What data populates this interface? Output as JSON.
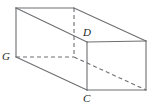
{
  "figure": {
    "type": "rectangular-prism-line-drawing",
    "stroke_color": "#6d6e71",
    "hidden_stroke_color": "#6d6e71",
    "background_color": "#ffffff",
    "stroke_width": 1,
    "dash_pattern": "4 3",
    "labels": {
      "g": "G",
      "d": "D",
      "c": "C"
    },
    "vertices": {
      "top_front_left": {
        "x": 16,
        "y": 8
      },
      "top_back_left": {
        "x": 74,
        "y": 8
      },
      "top_back_right": {
        "x": 146,
        "y": 41
      },
      "top_front_right_D": {
        "x": 87,
        "y": 42
      },
      "bottom_front_left_G": {
        "x": 16,
        "y": 57
      },
      "bottom_back_left": {
        "x": 74,
        "y": 57
      },
      "bottom_back_right": {
        "x": 146,
        "y": 90
      },
      "bottom_front_right_C": {
        "x": 87,
        "y": 90
      }
    },
    "edges": [
      {
        "name": "top-left-edge",
        "from": "top_front_left",
        "to": "top_back_left",
        "hidden": false
      },
      {
        "name": "top-back-right-edge",
        "from": "top_back_left",
        "to": "top_back_right",
        "hidden": false
      },
      {
        "name": "top-front-diagonal-edge",
        "from": "top_front_left",
        "to": "top_front_right_D",
        "hidden": false
      },
      {
        "name": "top-right-face-edge",
        "from": "top_front_right_D",
        "to": "top_back_right",
        "hidden": false
      },
      {
        "name": "left-vertical-edge",
        "from": "top_front_left",
        "to": "bottom_front_left_G",
        "hidden": false
      },
      {
        "name": "right-front-vertical-edge",
        "from": "top_front_right_D",
        "to": "bottom_front_right_C",
        "hidden": false
      },
      {
        "name": "right-back-vertical-edge",
        "from": "top_back_right",
        "to": "bottom_back_right",
        "hidden": false
      },
      {
        "name": "bottom-front-diagonal-edge",
        "from": "bottom_front_left_G",
        "to": "bottom_front_right_C",
        "hidden": false
      },
      {
        "name": "bottom-front-right-edge",
        "from": "bottom_front_right_C",
        "to": "bottom_back_right",
        "hidden": false
      },
      {
        "name": "hidden-back-vertical-edge",
        "from": "top_back_left",
        "to": "bottom_back_left",
        "hidden": true
      },
      {
        "name": "hidden-bottom-left-edge",
        "from": "bottom_front_left_G",
        "to": "bottom_back_left",
        "hidden": true
      },
      {
        "name": "hidden-bottom-back-edge",
        "from": "bottom_back_left",
        "to": "bottom_back_right",
        "hidden": true
      }
    ]
  }
}
